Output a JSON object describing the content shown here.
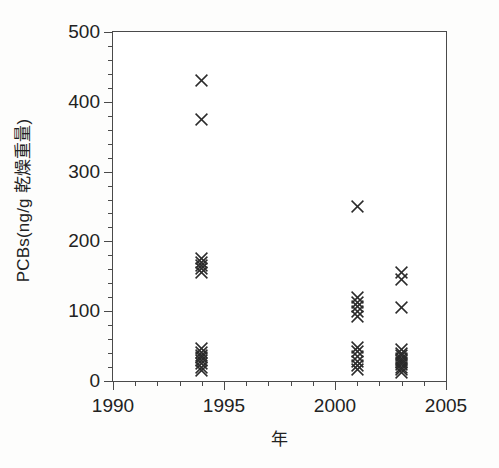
{
  "chart_data": {
    "type": "scatter",
    "title": "",
    "xlabel": "年",
    "ylabel": "PCBs(ng/g 乾燥重量)",
    "xlim": [
      1990,
      2005
    ],
    "ylim": [
      0,
      500
    ],
    "grid": false,
    "legend": null,
    "marker": "x",
    "marker_color": "#2b2b2b",
    "xticks": [
      1990,
      1995,
      2000,
      2005
    ],
    "xtick_labels": [
      "1990",
      "1995",
      "2000",
      "2005"
    ],
    "xminor_step": 1,
    "yticks": [
      0,
      100,
      200,
      300,
      400,
      500
    ],
    "ytick_labels": [
      "0",
      "100",
      "200",
      "300",
      "400",
      "500"
    ],
    "yminor_step": 20,
    "series": [
      {
        "name": "PCBs",
        "points": [
          {
            "x": 1994,
            "y": 430
          },
          {
            "x": 1994,
            "y": 375
          },
          {
            "x": 1994,
            "y": 175
          },
          {
            "x": 1994,
            "y": 170
          },
          {
            "x": 1994,
            "y": 166
          },
          {
            "x": 1994,
            "y": 161
          },
          {
            "x": 1994,
            "y": 155
          },
          {
            "x": 1994,
            "y": 46
          },
          {
            "x": 1994,
            "y": 41
          },
          {
            "x": 1994,
            "y": 37
          },
          {
            "x": 1994,
            "y": 33
          },
          {
            "x": 1994,
            "y": 29
          },
          {
            "x": 1994,
            "y": 25
          },
          {
            "x": 1994,
            "y": 20
          },
          {
            "x": 1994,
            "y": 15
          },
          {
            "x": 2001,
            "y": 250
          },
          {
            "x": 2001,
            "y": 119
          },
          {
            "x": 2001,
            "y": 113
          },
          {
            "x": 2001,
            "y": 107
          },
          {
            "x": 2001,
            "y": 99
          },
          {
            "x": 2001,
            "y": 93
          },
          {
            "x": 2001,
            "y": 48
          },
          {
            "x": 2001,
            "y": 42
          },
          {
            "x": 2001,
            "y": 35
          },
          {
            "x": 2001,
            "y": 28
          },
          {
            "x": 2001,
            "y": 22
          },
          {
            "x": 2001,
            "y": 16
          },
          {
            "x": 2003,
            "y": 155
          },
          {
            "x": 2003,
            "y": 145
          },
          {
            "x": 2003,
            "y": 105
          },
          {
            "x": 2003,
            "y": 45
          },
          {
            "x": 2003,
            "y": 40
          },
          {
            "x": 2003,
            "y": 36
          },
          {
            "x": 2003,
            "y": 32
          },
          {
            "x": 2003,
            "y": 29
          },
          {
            "x": 2003,
            "y": 26
          },
          {
            "x": 2003,
            "y": 23
          },
          {
            "x": 2003,
            "y": 20
          },
          {
            "x": 2003,
            "y": 16
          },
          {
            "x": 2003,
            "y": 12
          }
        ]
      }
    ]
  }
}
